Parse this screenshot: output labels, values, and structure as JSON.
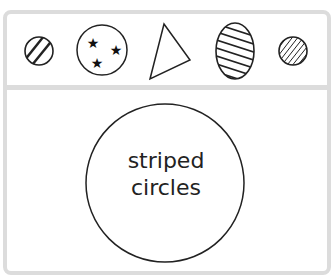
{
  "shapes_row": [
    {
      "name": "small-striped-circle",
      "pattern": "diagonal stripes"
    },
    {
      "name": "circle-with-three-stars",
      "pattern": "stars",
      "count": 3
    },
    {
      "name": "triangle",
      "pattern": "none"
    },
    {
      "name": "striped-oval",
      "pattern": "diagonal stripes"
    },
    {
      "name": "small-densely-striped-circle",
      "pattern": "dense stripes"
    }
  ],
  "sorting_circle": {
    "label_line1": "striped",
    "label_line2": "circles"
  },
  "colors": {
    "border": "#dcdcdc",
    "stroke": "#222222"
  }
}
